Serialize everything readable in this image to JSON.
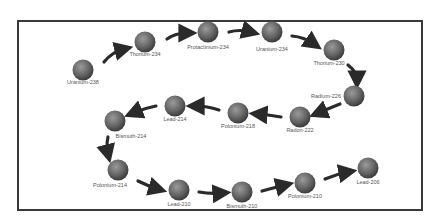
{
  "diagram": {
    "type": "decay-chain",
    "colors": {
      "frame": "#3a3a3a",
      "ball_light": "#8a8a8a",
      "ball_dark": "#3c3c3c",
      "arrow": "#2a2a2a",
      "label": "#555555"
    },
    "nodes": [
      {
        "id": "u238",
        "label": "Uranium-238",
        "x": 83,
        "y": 70,
        "label_x": 83,
        "label_y": 84,
        "anchor": "middle"
      },
      {
        "id": "th234",
        "label": "Thorium-234",
        "x": 145,
        "y": 42,
        "label_x": 145,
        "label_y": 56,
        "anchor": "middle"
      },
      {
        "id": "pa234",
        "label": "Protactinium-234",
        "x": 208,
        "y": 32,
        "label_x": 208,
        "label_y": 49,
        "anchor": "middle"
      },
      {
        "id": "u234",
        "label": "Uranium-234",
        "x": 272,
        "y": 32,
        "label_x": 272,
        "label_y": 51,
        "anchor": "middle"
      },
      {
        "id": "th230",
        "label": "Thorium-230",
        "x": 334,
        "y": 50,
        "label_x": 329,
        "label_y": 65,
        "anchor": "middle"
      },
      {
        "id": "ra226",
        "label": "Radium-226",
        "x": 354,
        "y": 96,
        "label_x": 341,
        "label_y": 98,
        "anchor": "end"
      },
      {
        "id": "rn222",
        "label": "Radon-222",
        "x": 300,
        "y": 117,
        "label_x": 300,
        "label_y": 132,
        "anchor": "middle"
      },
      {
        "id": "po218",
        "label": "Polonium-218",
        "x": 238,
        "y": 113,
        "label_x": 238,
        "label_y": 128,
        "anchor": "middle"
      },
      {
        "id": "pb214",
        "label": "Lead-214",
        "x": 175,
        "y": 106,
        "label_x": 175,
        "label_y": 121,
        "anchor": "middle"
      },
      {
        "id": "bi214",
        "label": "Bismuth-214",
        "x": 115,
        "y": 121,
        "label_x": 131,
        "label_y": 138,
        "anchor": "middle"
      },
      {
        "id": "po214",
        "label": "Polonium-214",
        "x": 118,
        "y": 170,
        "label_x": 110,
        "label_y": 187,
        "anchor": "middle"
      },
      {
        "id": "pb210",
        "label": "Lead-210",
        "x": 179,
        "y": 190,
        "label_x": 179,
        "label_y": 206,
        "anchor": "middle"
      },
      {
        "id": "bi210",
        "label": "Bismuth-210",
        "x": 242,
        "y": 192,
        "label_x": 242,
        "label_y": 208,
        "anchor": "middle"
      },
      {
        "id": "po210",
        "label": "Polonium-210",
        "x": 305,
        "y": 183,
        "label_x": 305,
        "label_y": 198,
        "anchor": "middle"
      },
      {
        "id": "pb206",
        "label": "Lead-206",
        "x": 368,
        "y": 168,
        "label_x": 368,
        "label_y": 184,
        "anchor": "middle"
      }
    ],
    "arrows": [
      {
        "from": "u238",
        "to": "th234",
        "d": "M104,62 Q112,52 124,49"
      },
      {
        "from": "th234",
        "to": "pa234",
        "d": "M167,39 Q175,33 188,33"
      },
      {
        "from": "pa234",
        "to": "u234",
        "d": "M229,32 Q240,29 251,32"
      },
      {
        "from": "u234",
        "to": "th230",
        "d": "M292,36 Q304,37 314,44"
      },
      {
        "from": "th230",
        "to": "ra226",
        "d": "M348,65 Q357,72 357,80"
      },
      {
        "from": "ra226",
        "to": "rn222",
        "d": "M340,104 Q330,108 318,113"
      },
      {
        "from": "rn222",
        "to": "po218",
        "d": "M281,117 Q270,115 258,114"
      },
      {
        "from": "po218",
        "to": "pb214",
        "d": "M219,110 Q207,106 195,106"
      },
      {
        "from": "pb214",
        "to": "bi214",
        "d": "M156,106 Q145,108 133,113"
      },
      {
        "from": "bi214",
        "to": "po214",
        "d": "M108,137 Q106,146 108,154"
      },
      {
        "from": "po214",
        "to": "pb210",
        "d": "M138,181 Q148,186 158,189"
      },
      {
        "from": "pb210",
        "to": "bi210",
        "d": "M199,192 Q210,194 222,193"
      },
      {
        "from": "bi210",
        "to": "po210",
        "d": "M262,191 Q273,188 285,185"
      },
      {
        "from": "po210",
        "to": "pb206",
        "d": "M325,179 Q337,174 348,172"
      }
    ]
  }
}
